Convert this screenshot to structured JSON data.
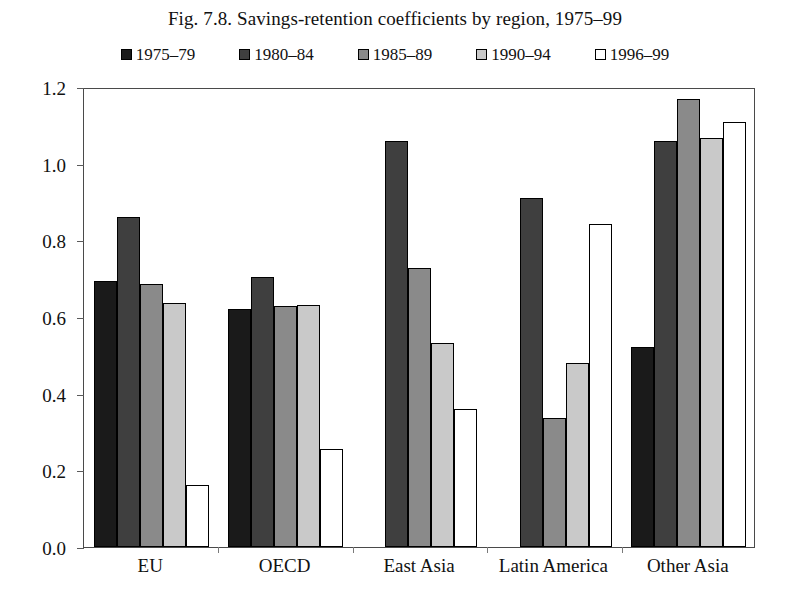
{
  "title": "Fig. 7.8.  Savings-retention coefficients by region, 1975–99",
  "legend": {
    "position": "top",
    "items": [
      {
        "label": "1975–79",
        "color": "#1a1a1a"
      },
      {
        "label": "1980–84",
        "color": "#3f3f3f"
      },
      {
        "label": "1985–89",
        "color": "#8a8a8a"
      },
      {
        "label": "1990–94",
        "color": "#c9c9c9"
      },
      {
        "label": "1996–99",
        "color": "#ffffff"
      }
    ]
  },
  "axes": {
    "y_ticks": [
      "0.0",
      "0.2",
      "0.4",
      "0.6",
      "0.8",
      "1.0",
      "1.2"
    ],
    "x_categories": [
      "EU",
      "OECD",
      "East Asia",
      "Latin America",
      "Other Asia"
    ]
  },
  "chart_data": {
    "type": "bar",
    "title": "Fig. 7.8.  Savings-retention coefficients by region, 1975–99",
    "xlabel": "",
    "ylabel": "",
    "ylim": [
      0.0,
      1.2
    ],
    "ytick_step": 0.2,
    "grid": false,
    "legend_position": "top",
    "categories": [
      "EU",
      "OECD",
      "East Asia",
      "Latin America",
      "Other Asia"
    ],
    "series": [
      {
        "name": "1975–79",
        "color": "#1a1a1a",
        "values": [
          0.695,
          0.622,
          null,
          null,
          0.522
        ]
      },
      {
        "name": "1980–84",
        "color": "#3f3f3f",
        "values": [
          0.862,
          0.705,
          1.06,
          0.91,
          1.058
        ]
      },
      {
        "name": "1985–89",
        "color": "#8a8a8a",
        "values": [
          0.687,
          0.628,
          0.728,
          0.337,
          1.17
        ]
      },
      {
        "name": "1990–94",
        "color": "#c9c9c9",
        "values": [
          0.637,
          0.632,
          0.532,
          0.481,
          1.068
        ]
      },
      {
        "name": "1996–99",
        "color": "#ffffff",
        "values": [
          0.162,
          0.255,
          0.36,
          0.843,
          1.11
        ]
      }
    ]
  }
}
